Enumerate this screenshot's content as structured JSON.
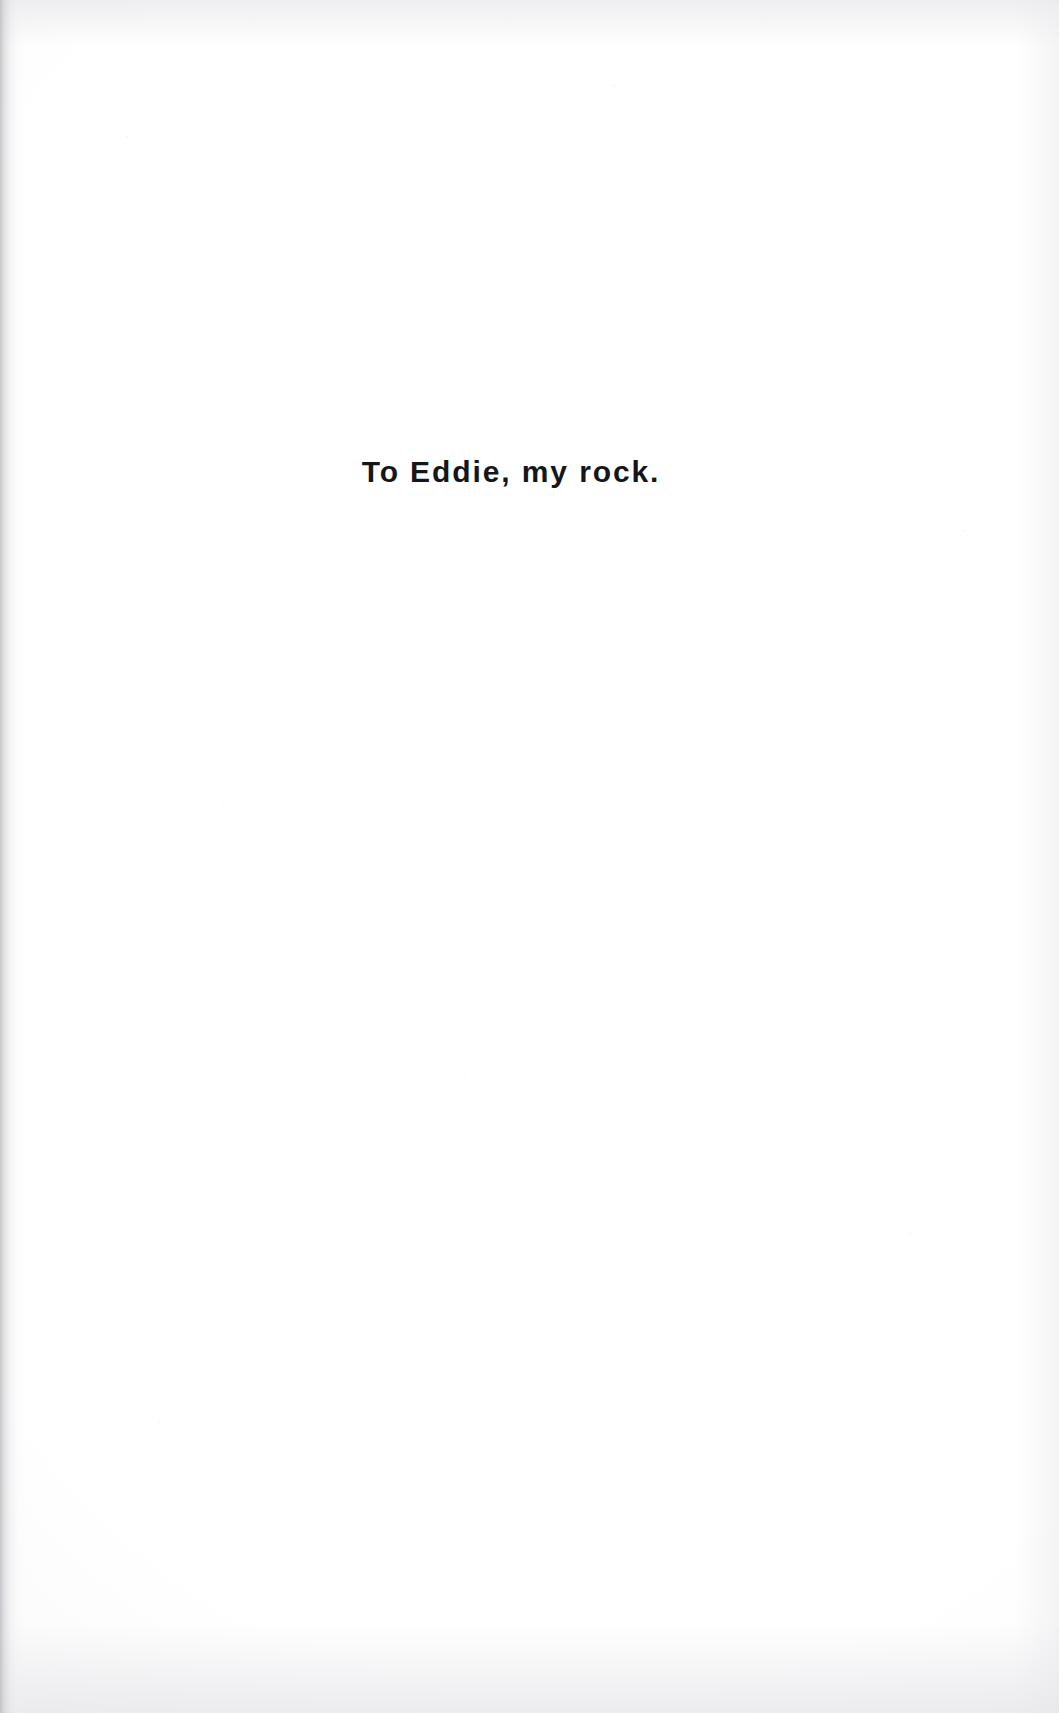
{
  "document": {
    "type": "book-dedication-page",
    "page_background_color": "#ffffff",
    "text_color": "#15161a",
    "gutter_shadow_color": "#bcbcc0"
  },
  "dedication": {
    "line": "To Eddie, my rock."
  },
  "page_marks": {
    "header": "",
    "footer": "",
    "page_number": ""
  }
}
